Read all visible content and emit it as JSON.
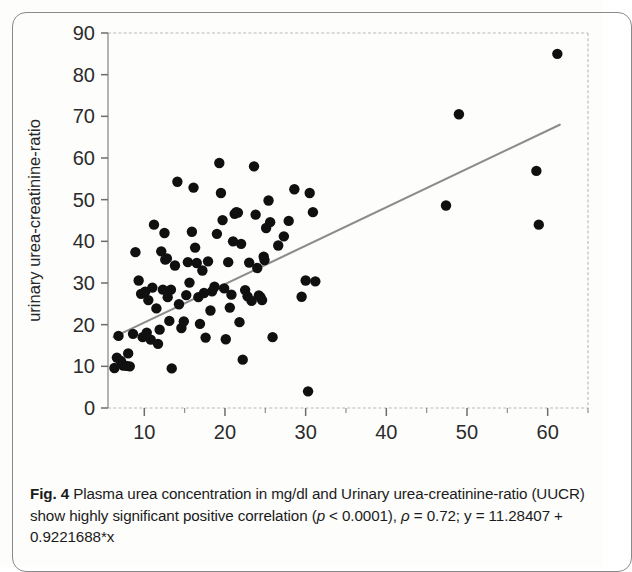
{
  "figure": {
    "label": "Fig. 4",
    "caption_part1": " Plasma urea concentration in mg/dl and Urinary urea-creatinine-ratio (UUCR) show highly significant positive correlation (",
    "caption_p_italic": "p",
    "caption_part2": " < 0.0001), ",
    "caption_rho_italic": "ρ",
    "caption_part3": " = 0.72; y = 11.28407 + 0.9221688*x"
  },
  "chart_data": {
    "type": "scatter",
    "title": "",
    "xlabel": "plasma urea concentrations (mg/dl)",
    "ylabel": "urinary urea-creatinine-ratio",
    "xlim": [
      5.5,
      65.0
    ],
    "ylim": [
      0,
      90
    ],
    "xticks": [
      10,
      20,
      30,
      40,
      50,
      60
    ],
    "xtick_labels": [
      "10",
      "20",
      "30",
      "40",
      "50",
      "60"
    ],
    "xminor_ticks": [
      15,
      25,
      35,
      45,
      55,
      65
    ],
    "yticks": [
      0,
      10,
      20,
      30,
      40,
      50,
      60,
      70,
      80,
      90
    ],
    "ytick_labels": [
      "0",
      "10",
      "20",
      "30",
      "40",
      "50",
      "60",
      "70",
      "80",
      "90"
    ],
    "grid": false,
    "legend": null,
    "marker_color": "#101010",
    "marker_size": 5.2,
    "fit_line": {
      "label": "linear regression",
      "equation": "y = 11.28407 + 0.9221688*x",
      "intercept": 11.28407,
      "slope": 0.9221688,
      "color": "#8c8c8c",
      "x_start": 6.2,
      "x_end": 61.5,
      "rho": 0.72,
      "p_value": "< 0.0001"
    },
    "points": [
      [
        6.3,
        9.6
      ],
      [
        6.6,
        12.1
      ],
      [
        6.8,
        17.3
      ],
      [
        7.1,
        11.3
      ],
      [
        7.4,
        10.2
      ],
      [
        7.8,
        10.1
      ],
      [
        8.0,
        13.1
      ],
      [
        8.2,
        10.0
      ],
      [
        8.6,
        17.8
      ],
      [
        8.9,
        37.4
      ],
      [
        9.3,
        30.6
      ],
      [
        9.6,
        27.4
      ],
      [
        9.8,
        17.0
      ],
      [
        10.1,
        27.9
      ],
      [
        10.3,
        18.1
      ],
      [
        10.5,
        25.9
      ],
      [
        10.8,
        16.4
      ],
      [
        11.0,
        28.9
      ],
      [
        11.2,
        44.0
      ],
      [
        11.5,
        23.9
      ],
      [
        11.7,
        15.4
      ],
      [
        11.9,
        18.8
      ],
      [
        12.1,
        37.6
      ],
      [
        12.3,
        28.4
      ],
      [
        12.5,
        42.0
      ],
      [
        12.6,
        35.6
      ],
      [
        12.8,
        35.9
      ],
      [
        12.9,
        26.6
      ],
      [
        13.1,
        20.9
      ],
      [
        13.3,
        28.4
      ],
      [
        13.4,
        9.5
      ],
      [
        13.8,
        34.2
      ],
      [
        14.1,
        54.3
      ],
      [
        14.3,
        24.9
      ],
      [
        14.6,
        19.2
      ],
      [
        14.9,
        20.8
      ],
      [
        15.2,
        27.1
      ],
      [
        15.4,
        35.0
      ],
      [
        15.6,
        30.1
      ],
      [
        15.9,
        42.3
      ],
      [
        16.1,
        52.9
      ],
      [
        16.3,
        38.5
      ],
      [
        16.5,
        34.8
      ],
      [
        16.7,
        26.6
      ],
      [
        16.9,
        20.2
      ],
      [
        17.2,
        33.0
      ],
      [
        17.4,
        27.6
      ],
      [
        17.6,
        16.9
      ],
      [
        17.9,
        35.2
      ],
      [
        18.2,
        23.4
      ],
      [
        18.4,
        28.0
      ],
      [
        18.7,
        29.1
      ],
      [
        19.0,
        41.8
      ],
      [
        19.3,
        58.8
      ],
      [
        19.5,
        51.6
      ],
      [
        19.7,
        45.1
      ],
      [
        19.9,
        28.7
      ],
      [
        20.1,
        16.5
      ],
      [
        20.4,
        35.0
      ],
      [
        20.6,
        24.1
      ],
      [
        20.8,
        27.2
      ],
      [
        21.0,
        40.0
      ],
      [
        21.2,
        46.6
      ],
      [
        21.4,
        47.0
      ],
      [
        21.6,
        46.9
      ],
      [
        21.8,
        20.6
      ],
      [
        22.0,
        39.4
      ],
      [
        22.2,
        11.6
      ],
      [
        22.5,
        28.3
      ],
      [
        22.8,
        26.8
      ],
      [
        23.0,
        34.9
      ],
      [
        23.3,
        25.7
      ],
      [
        23.6,
        58.0
      ],
      [
        23.8,
        46.4
      ],
      [
        24.0,
        33.6
      ],
      [
        24.2,
        27.0
      ],
      [
        24.4,
        26.6
      ],
      [
        24.6,
        25.9
      ],
      [
        24.8,
        36.3
      ],
      [
        24.9,
        35.5
      ],
      [
        25.1,
        43.2
      ],
      [
        25.4,
        49.8
      ],
      [
        25.6,
        44.6
      ],
      [
        25.9,
        17.0
      ],
      [
        26.6,
        39.0
      ],
      [
        27.3,
        41.2
      ],
      [
        27.9,
        44.9
      ],
      [
        28.6,
        52.5
      ],
      [
        29.5,
        26.7
      ],
      [
        30.0,
        30.6
      ],
      [
        30.3,
        4.0
      ],
      [
        30.5,
        51.6
      ],
      [
        30.9,
        47.0
      ],
      [
        31.2,
        30.4
      ],
      [
        47.4,
        48.6
      ],
      [
        49.0,
        70.5
      ],
      [
        58.6,
        56.9
      ],
      [
        58.9,
        44.0
      ],
      [
        61.2,
        85.0
      ]
    ]
  }
}
